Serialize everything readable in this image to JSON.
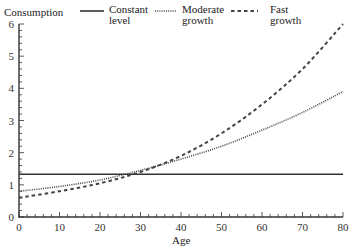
{
  "chart_data": {
    "type": "line",
    "title": "",
    "ylabel": "Consumption",
    "xlabel": "Age",
    "xlim": [
      0,
      80
    ],
    "ylim": [
      0,
      6
    ],
    "xticks": [
      "0",
      "10",
      "20",
      "30",
      "40",
      "50",
      "60",
      "70",
      "80"
    ],
    "yticks": [
      "0",
      "1",
      "2",
      "3",
      "4",
      "5",
      "6"
    ],
    "grid": false,
    "legend_position": "top",
    "x": [
      0,
      10,
      20,
      30,
      40,
      50,
      60,
      70,
      80
    ],
    "series": [
      {
        "name": "Constant level",
        "style": "solid",
        "values": [
          1.33,
          1.33,
          1.33,
          1.33,
          1.33,
          1.33,
          1.33,
          1.33,
          1.33
        ]
      },
      {
        "name": "Moderate growth",
        "style": "dotted",
        "values": [
          0.8,
          0.95,
          1.15,
          1.45,
          1.8,
          2.2,
          2.7,
          3.25,
          3.9
        ]
      },
      {
        "name": "Fast growth",
        "style": "dashed",
        "values": [
          0.6,
          0.8,
          1.05,
          1.4,
          1.9,
          2.6,
          3.5,
          4.6,
          6.0
        ]
      }
    ]
  },
  "legend": {
    "y_title": "Consumption",
    "items": [
      {
        "label_line1": "Constant",
        "label_line2": "level"
      },
      {
        "label_line1": "Moderate",
        "label_line2": "growth"
      },
      {
        "label_line1": "Fast",
        "label_line2": "growth"
      }
    ]
  },
  "axes": {
    "x_title": "Age"
  }
}
